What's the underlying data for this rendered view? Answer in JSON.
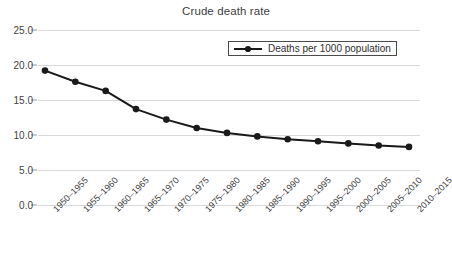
{
  "chart_data": {
    "type": "line",
    "title": "Crude death rate",
    "xlabel": "",
    "ylabel": "",
    "ylim": [
      0,
      25
    ],
    "yticks": [
      "0.0",
      "5.0",
      "10.0",
      "15.0",
      "20.0",
      "25.0"
    ],
    "ytick_values": [
      0,
      5,
      10,
      15,
      20,
      25
    ],
    "grid": true,
    "legend_position": "top-right-inside",
    "legend_entries": [
      "Deaths per 1000 population"
    ],
    "categories": [
      "1950–1955",
      "1955–1960",
      "1960–1965",
      "1965–1970",
      "1970–1975",
      "1975–1980",
      "1980–1985",
      "1985–1990",
      "1990–1995",
      "1995–2000",
      "2000–2005",
      "2005–2010",
      "2010–2015"
    ],
    "series": [
      {
        "name": "Deaths per 1000 population",
        "color": "#1a1a1a",
        "marker": "circle",
        "values": [
          19.2,
          17.6,
          16.3,
          13.7,
          12.2,
          11.0,
          10.3,
          9.8,
          9.4,
          9.1,
          8.8,
          8.5,
          8.3
        ]
      }
    ]
  },
  "style": {
    "grid_color": "#d9d9d9",
    "axis_text_color": "#3f3f3f",
    "title_color": "#404040",
    "series_color": "#1a1a1a",
    "background": "#ffffff"
  }
}
